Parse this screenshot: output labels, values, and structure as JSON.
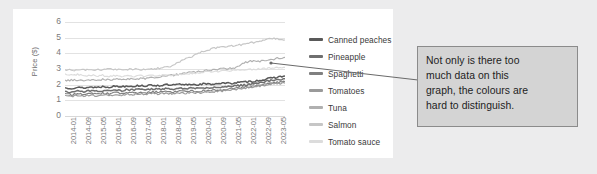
{
  "chart_data": {
    "type": "line",
    "title": "",
    "xlabel": "",
    "ylabel": "Price ($)",
    "ylim": [
      0,
      6
    ],
    "yticks": [
      "0",
      "1",
      "2",
      "3",
      "4",
      "5",
      "6"
    ],
    "grid": true,
    "legend_position": "right",
    "xticks": [
      "2014-01",
      "2014-09",
      "2015-05",
      "2016-01",
      "2016-09",
      "2017-05",
      "2018-01",
      "2018-09",
      "2019-05",
      "2020-01",
      "2020-09",
      "2021-05",
      "2022-01",
      "2022-09",
      "2023-05"
    ],
    "series": [
      {
        "name": "Canned peaches",
        "color": "#595959",
        "values": [
          1.8,
          1.78,
          1.82,
          1.79,
          1.85,
          1.83,
          1.88,
          1.86,
          1.9,
          1.88,
          1.93,
          1.9,
          1.95,
          1.92,
          1.97,
          1.94,
          1.99,
          1.96,
          2.01,
          1.98,
          2.03,
          2.0,
          2.05,
          2.02,
          2.07,
          2.1,
          2.08,
          2.12,
          2.15,
          2.18,
          2.22,
          2.28,
          2.35,
          2.42,
          2.5,
          2.55
        ]
      },
      {
        "name": "Pineapple",
        "color": "#6f6f6f",
        "values": [
          1.55,
          1.52,
          1.58,
          1.55,
          1.6,
          1.57,
          1.62,
          1.6,
          1.65,
          1.63,
          1.68,
          1.66,
          1.7,
          1.68,
          1.72,
          1.7,
          1.74,
          1.72,
          1.76,
          1.74,
          1.78,
          1.76,
          1.8,
          1.78,
          1.82,
          1.85,
          1.88,
          1.92,
          1.96,
          2.0,
          2.06,
          2.12,
          2.2,
          2.28,
          2.34,
          2.38
        ]
      },
      {
        "name": "Spaghetti",
        "color": "#808080",
        "values": [
          1.4,
          1.36,
          1.42,
          1.38,
          1.44,
          1.4,
          1.46,
          1.42,
          1.48,
          1.45,
          1.5,
          1.47,
          1.52,
          1.49,
          1.54,
          1.51,
          1.56,
          1.53,
          1.58,
          1.55,
          1.6,
          1.58,
          1.62,
          1.6,
          1.65,
          1.68,
          1.72,
          1.76,
          1.8,
          1.86,
          1.92,
          1.98,
          2.04,
          2.1,
          2.16,
          2.2
        ]
      },
      {
        "name": "Tomatoes",
        "color": "#9a9a9a",
        "values": [
          1.3,
          1.25,
          1.32,
          1.27,
          1.34,
          1.29,
          1.36,
          1.31,
          1.38,
          1.33,
          1.4,
          1.36,
          1.42,
          1.38,
          1.44,
          1.4,
          1.46,
          1.42,
          1.48,
          1.44,
          1.5,
          1.46,
          1.52,
          1.5,
          1.55,
          1.6,
          1.64,
          1.7,
          1.75,
          1.8,
          1.86,
          1.92,
          1.98,
          2.04,
          2.08,
          2.1
        ]
      },
      {
        "name": "Tuna",
        "color": "#b0b0b0",
        "values": [
          2.25,
          2.28,
          2.3,
          2.27,
          2.32,
          2.29,
          2.34,
          2.31,
          2.36,
          2.33,
          2.38,
          2.35,
          2.4,
          2.38,
          2.45,
          2.5,
          2.55,
          2.6,
          2.66,
          2.72,
          2.78,
          2.84,
          2.88,
          2.92,
          2.96,
          3.0,
          3.04,
          3.08,
          3.3,
          3.45,
          3.52,
          3.48,
          3.55,
          3.62,
          3.7,
          3.74
        ]
      },
      {
        "name": "Salmon",
        "color": "#c6c6c6",
        "values": [
          2.9,
          2.95,
          2.92,
          2.97,
          2.93,
          2.98,
          2.94,
          2.99,
          2.95,
          3.0,
          2.96,
          3.01,
          2.97,
          2.95,
          3.0,
          3.05,
          3.1,
          3.2,
          3.45,
          3.6,
          3.75,
          4.0,
          4.15,
          4.25,
          4.35,
          4.4,
          4.45,
          4.5,
          4.55,
          4.62,
          4.7,
          4.78,
          4.88,
          4.95,
          4.92,
          4.85
        ]
      },
      {
        "name": "Tomato sauce",
        "color": "#dcdcdc",
        "values": [
          2.7,
          2.6,
          2.66,
          2.56,
          2.62,
          2.54,
          2.6,
          2.52,
          2.58,
          2.5,
          2.56,
          2.52,
          2.58,
          2.54,
          2.6,
          2.58,
          2.62,
          2.6,
          2.66,
          2.64,
          2.7,
          2.74,
          2.78,
          2.82,
          2.86,
          2.88,
          2.9,
          2.92,
          2.94,
          2.96,
          2.98,
          3.0,
          3.02,
          3.06,
          3.08,
          3.1
        ]
      }
    ]
  },
  "legend": {
    "items": [
      {
        "label": "Canned peaches",
        "color": "#595959"
      },
      {
        "label": "Pineapple",
        "color": "#6f6f6f"
      },
      {
        "label": "Spaghetti",
        "color": "#808080"
      },
      {
        "label": "Tomatoes",
        "color": "#9a9a9a"
      },
      {
        "label": "Tuna",
        "color": "#b0b0b0"
      },
      {
        "label": "Salmon",
        "color": "#c6c6c6"
      },
      {
        "label": "Tomato sauce",
        "color": "#dcdcdc"
      }
    ]
  },
  "callout": {
    "lines": [
      "Not only is there too",
      "much data on this",
      "graph, the colours are",
      "hard to distinguish."
    ],
    "background": "#d4d4d4",
    "border": "#8b8b8b"
  },
  "colors": {
    "page_background": "#ececed",
    "card_background": "#ffffff",
    "gridline": "#e2e2e2",
    "tick_text": "#7a7a7a"
  }
}
